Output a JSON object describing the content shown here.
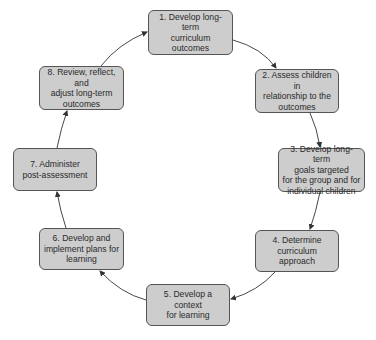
{
  "diagram": {
    "type": "cycle",
    "colors": {
      "box_fill": "#cdcdcd",
      "box_border": "#555555",
      "arrow": "#333333",
      "text": "#2a2a2a"
    },
    "steps": [
      {
        "number": 1,
        "label": "1. Develop long-term\ncurriculum outcomes"
      },
      {
        "number": 2,
        "label": "2. Assess children in\nrelationship to the\noutcomes"
      },
      {
        "number": 3,
        "label": "3. Develop long-term\ngoals targeted\nfor the group and for\nindividual children"
      },
      {
        "number": 4,
        "label": "4. Determine\ncurriculum approach"
      },
      {
        "number": 5,
        "label": "5. Develop a context\nfor learning"
      },
      {
        "number": 6,
        "label": "6. Develop and\nimplement plans for\nlearning"
      },
      {
        "number": 7,
        "label": "7. Administer\npost-assessment"
      },
      {
        "number": 8,
        "label": "8. Review, reflect, and\nadjust long-term\noutcomes"
      }
    ],
    "connections": [
      {
        "from": 1,
        "to": 2
      },
      {
        "from": 2,
        "to": 3
      },
      {
        "from": 3,
        "to": 4
      },
      {
        "from": 4,
        "to": 5
      },
      {
        "from": 5,
        "to": 6
      },
      {
        "from": 6,
        "to": 7
      },
      {
        "from": 7,
        "to": 8
      },
      {
        "from": 8,
        "to": 1
      }
    ]
  }
}
